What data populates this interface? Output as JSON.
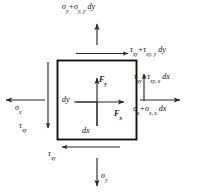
{
  "figure": {
    "name": "differential-stress-element",
    "element": {
      "shape": "square",
      "stroke_color": "#141414",
      "fill_color": "#ffffff",
      "x": 57,
      "y": 60,
      "width": 80,
      "height": 80
    },
    "colors": {
      "line": "#2b2b2b",
      "element_border": "#141414",
      "text": "#111111",
      "background": "#ffffff"
    }
  },
  "labels": {
    "sigma_y_top": {
      "parts": [
        "σ",
        "y",
        " + ",
        "σ",
        "y, y",
        " dy"
      ],
      "text": "σy + σy, y dy",
      "position": "top-outside",
      "arrow": "up"
    },
    "tau_top": {
      "text": "τxy + τxy, y dy",
      "position": "top-inside-right",
      "arrow": "right"
    },
    "tau_right": {
      "text": "τxy + τxy, x dx",
      "position": "right-upper",
      "arrow": "up"
    },
    "sigma_x_right": {
      "text": "σx + σx, x dx",
      "position": "right-lower",
      "arrow": "right"
    },
    "sigma_x_left": {
      "text": "σx",
      "position": "left-middle",
      "arrow": "left"
    },
    "tau_left": {
      "text": "τxy",
      "position": "left-lower",
      "arrow": "down"
    },
    "tau_bottom": {
      "text": "τxy",
      "position": "bottom-inside",
      "arrow": "left"
    },
    "sigma_y_bottom": {
      "text": "σy",
      "position": "bottom-outside",
      "arrow": "down"
    },
    "force_y": {
      "text": "Fy",
      "position": "center-up",
      "arrow": "up"
    },
    "force_x": {
      "text": "Fx",
      "position": "center-right",
      "arrow": "right"
    },
    "dim_dy": {
      "text": "dy",
      "position": "center-left"
    },
    "dim_dx": {
      "text": "dx",
      "position": "center-bottom"
    }
  },
  "glyphs": {
    "sigma": "σ",
    "tau": "τ",
    "sub_x": "x",
    "sub_y": "y",
    "sub_xy": "xy",
    "sub_y_comma_y": "y, y",
    "sub_xy_comma_y": "xy, y",
    "sub_xy_comma_x": "xy, x",
    "sub_x_comma_x": "x, x",
    "plus": "+",
    "dx": "dx",
    "dy": "dy",
    "F": "F"
  }
}
